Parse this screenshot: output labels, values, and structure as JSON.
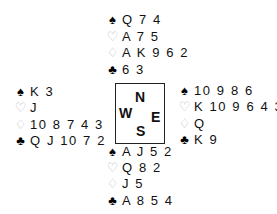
{
  "suit_symbols": {
    "spades": "♠",
    "hearts": "♡",
    "diamonds": "♢",
    "clubs": "♣"
  },
  "colors": {
    "black_suits": "#000000",
    "red_suits_outline": "#bdbdbd"
  },
  "compass": {
    "north": "N",
    "south": "S",
    "east": "E",
    "west": "W"
  },
  "hands": {
    "north": {
      "spades": "Q 7 4",
      "hearts": "A 7 5",
      "diamonds": "A K 9 6 2",
      "clubs": "6 3"
    },
    "west": {
      "spades": "K 3",
      "hearts": "J",
      "diamonds": "10 8 7 4 3",
      "clubs": "Q J 10 7 2"
    },
    "east": {
      "spades": "10 9 8 6",
      "hearts": "K 10 9 6 4 3",
      "diamonds": "Q",
      "clubs": "K 9"
    },
    "south": {
      "spades": "A J 5 2",
      "hearts": "Q 8 2",
      "diamonds": "J 5",
      "clubs": "A 8 5 4"
    }
  }
}
